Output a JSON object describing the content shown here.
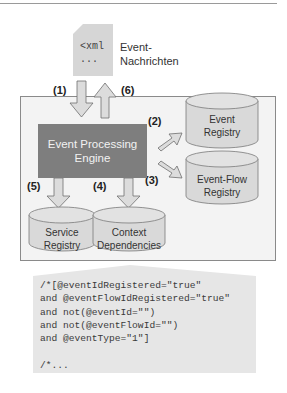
{
  "document_icon": {
    "lines": [
      "<xml",
      "..."
    ],
    "label_line1": "Event-",
    "label_line2": "Nachrichten"
  },
  "steps": {
    "s1": "(1)",
    "s2": "(2)",
    "s3": "(3)",
    "s4": "(4)",
    "s5": "(5)",
    "s6": "(6)"
  },
  "engine": {
    "line1": "Event Processing",
    "line2": "Engine"
  },
  "registries": {
    "event_registry": {
      "line1": "Event",
      "line2": "Registry"
    },
    "event_flow_registry": {
      "line1": "Event-Flow",
      "line2": "Registry"
    },
    "service_registry": {
      "line1": "Service",
      "line2": "Registry"
    },
    "context_dependencies": {
      "line1": "Context",
      "line2": "Dependencies"
    }
  },
  "code": {
    "lines": [
      "/*[@eventIdRegistered=\"true\"",
      "and @eventFlowIdRegistered=\"true\"",
      "and not(@eventId=\"\")",
      "and not(@eventFlowId=\"\")",
      "and @eventType=\"1\"]",
      "",
      "/*..."
    ]
  },
  "colors": {
    "engine_fill": "#7e7e7e",
    "cylinder_fill": "#d9d9d9",
    "arrow_fill": "#dcdcdc",
    "panel_fill": "#f3f3f3",
    "callout_fill": "#e6e6e6"
  }
}
